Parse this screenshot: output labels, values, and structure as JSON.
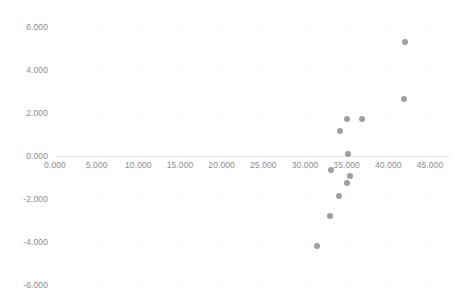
{
  "chart_data": {
    "type": "scatter",
    "title": "",
    "subtitle": "",
    "xlabel": "",
    "ylabel": "",
    "xlim": [
      0,
      45
    ],
    "ylim": [
      -6,
      6
    ],
    "grid": true,
    "legend": null,
    "x_ticks": [
      "0.000",
      "5.000",
      "10.000",
      "15.000",
      "20.000",
      "25.000",
      "30.000",
      "35.000",
      "40.000",
      "45.000"
    ],
    "x_tick_values": [
      0,
      5,
      10,
      15,
      20,
      25,
      30,
      35,
      40,
      45
    ],
    "y_ticks": [
      "6.000",
      "4.000",
      "2.000",
      "0.000",
      "-2.000",
      "-4.000",
      "-6.000"
    ],
    "y_tick_values": [
      6,
      4,
      2,
      0,
      -2,
      -4,
      -6
    ],
    "marker_color": "#9e9e9e",
    "series": [
      {
        "name": "Series 1",
        "points": [
          {
            "x": 42.0,
            "y": 5.3
          },
          {
            "x": 41.9,
            "y": 2.65
          },
          {
            "x": 35.0,
            "y": 1.7
          },
          {
            "x": 36.8,
            "y": 1.7
          },
          {
            "x": 34.2,
            "y": 1.15
          },
          {
            "x": 35.2,
            "y": 0.1
          },
          {
            "x": 33.1,
            "y": -0.65
          },
          {
            "x": 35.4,
            "y": -0.95
          },
          {
            "x": 35.0,
            "y": -1.25
          },
          {
            "x": 34.1,
            "y": -1.85
          },
          {
            "x": 33.0,
            "y": -2.8
          },
          {
            "x": 31.4,
            "y": -4.2
          }
        ]
      }
    ]
  }
}
